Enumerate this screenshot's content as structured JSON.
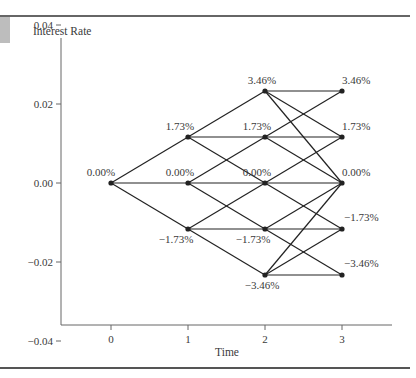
{
  "chart_data": {
    "type": "line",
    "subtype": "trinomial-interest-rate-tree",
    "title": "",
    "xlabel": "Time",
    "ylabel": "Interest Rate",
    "x_ticks": [
      "0",
      "1",
      "2",
      "3"
    ],
    "y_ticks": [
      "0.04",
      "0.02",
      "0.00",
      "-0.02",
      "-0.04"
    ],
    "y_tick_values": [
      0.04,
      0.02,
      0.0,
      -0.02,
      -0.04
    ],
    "xlim": [
      -0.65,
      3.65
    ],
    "ylim": [
      -0.06,
      0.05
    ],
    "grid": false,
    "legend": null,
    "nodes": [
      {
        "id": "n0_0",
        "t": 0,
        "rate": 0.0,
        "label": "0.00%"
      },
      {
        "id": "n1_u",
        "t": 1,
        "rate": 0.0173,
        "label": "1.73%"
      },
      {
        "id": "n1_m",
        "t": 1,
        "rate": 0.0,
        "label": "0.00%"
      },
      {
        "id": "n1_d",
        "t": 1,
        "rate": -0.0173,
        "label": "−1.73%"
      },
      {
        "id": "n2_uu",
        "t": 2,
        "rate": 0.0346,
        "label": "3.46%"
      },
      {
        "id": "n2_u",
        "t": 2,
        "rate": 0.0173,
        "label": "1.73%"
      },
      {
        "id": "n2_m",
        "t": 2,
        "rate": 0.0,
        "label": "0.00%"
      },
      {
        "id": "n2_d",
        "t": 2,
        "rate": -0.0173,
        "label": "−1.73%"
      },
      {
        "id": "n2_dd",
        "t": 2,
        "rate": -0.0346,
        "label": "−3.46%"
      },
      {
        "id": "n3_uu",
        "t": 3,
        "rate": 0.0346,
        "label": "3.46%"
      },
      {
        "id": "n3_u",
        "t": 3,
        "rate": 0.0173,
        "label": "1.73%"
      },
      {
        "id": "n3_m",
        "t": 3,
        "rate": 0.0,
        "label": "0.00%"
      },
      {
        "id": "n3_d",
        "t": 3,
        "rate": -0.0173,
        "label": "−1.73%"
      },
      {
        "id": "n3_dd",
        "t": 3,
        "rate": -0.0346,
        "label": "−3.46%"
      }
    ],
    "edges": [
      [
        "n0_0",
        "n1_u"
      ],
      [
        "n0_0",
        "n1_m"
      ],
      [
        "n0_0",
        "n1_d"
      ],
      [
        "n1_u",
        "n2_uu"
      ],
      [
        "n1_u",
        "n2_u"
      ],
      [
        "n1_u",
        "n2_m"
      ],
      [
        "n1_m",
        "n2_u"
      ],
      [
        "n1_m",
        "n2_m"
      ],
      [
        "n1_m",
        "n2_d"
      ],
      [
        "n1_d",
        "n2_m"
      ],
      [
        "n1_d",
        "n2_d"
      ],
      [
        "n1_d",
        "n2_dd"
      ],
      [
        "n2_uu",
        "n3_uu"
      ],
      [
        "n2_uu",
        "n3_u"
      ],
      [
        "n2_uu",
        "n3_m"
      ],
      [
        "n2_u",
        "n3_uu"
      ],
      [
        "n2_u",
        "n3_u"
      ],
      [
        "n2_u",
        "n3_m"
      ],
      [
        "n2_m",
        "n3_u"
      ],
      [
        "n2_m",
        "n3_m"
      ],
      [
        "n2_m",
        "n3_d"
      ],
      [
        "n2_d",
        "n3_m"
      ],
      [
        "n2_d",
        "n3_d"
      ],
      [
        "n2_d",
        "n3_dd"
      ],
      [
        "n2_dd",
        "n3_m"
      ],
      [
        "n2_dd",
        "n3_d"
      ],
      [
        "n2_dd",
        "n3_dd"
      ]
    ]
  },
  "colors": {
    "line": "#222222",
    "text": "#3a3a3a",
    "axis": "#555555",
    "rule": "#333333",
    "corner_block": "#b8b8b8"
  }
}
